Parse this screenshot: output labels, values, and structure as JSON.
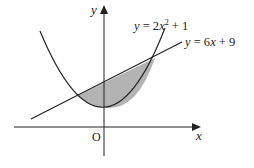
{
  "diagram": {
    "type": "area-between-curves",
    "curves": [
      {
        "name": "parabola",
        "equation": "y = 2x² + 1",
        "label_parts": {
          "lhs": "y",
          "eq": " = 2",
          "var": "x",
          "sup": "2",
          "rest": " + 1"
        }
      },
      {
        "name": "line",
        "equation": "y = 6x + 9",
        "label_parts": {
          "lhs": "y",
          "eq": " = 6",
          "var": "x",
          "rest": " + 9"
        }
      }
    ],
    "axes": {
      "x_label": "x",
      "y_label": "y",
      "origin_label": "O"
    },
    "shaded_region": "area enclosed between y = 2x² + 1 and y = 6x + 9",
    "colors": {
      "stroke": "#222222",
      "shade": "#b3b3b3",
      "background": "#ffffff"
    }
  }
}
